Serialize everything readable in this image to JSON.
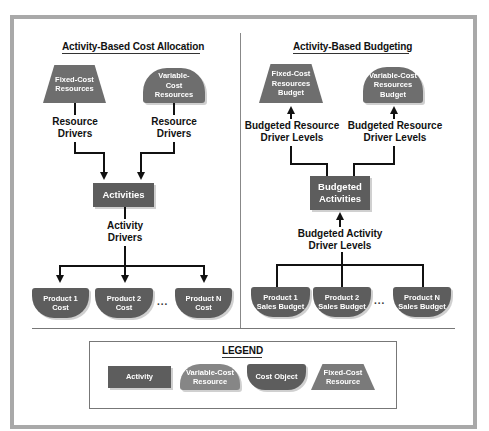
{
  "left_panel": {
    "title": "Activity-Based Cost Allocation",
    "fixed_cost": "Fixed-Cost Resources",
    "variable_cost_l1": "Variable-",
    "variable_cost_l2": "Cost",
    "variable_cost_l3": "Resources",
    "resource_drivers_left_l1": "Resource",
    "resource_drivers_left_l2": "Drivers",
    "resource_drivers_right_l1": "Resource",
    "resource_drivers_right_l2": "Drivers",
    "activities": "Activities",
    "activity_drivers_l1": "Activity",
    "activity_drivers_l2": "Drivers",
    "products": [
      {
        "l1": "Product 1",
        "l2": "Cost"
      },
      {
        "l1": "Product 2",
        "l2": "Cost"
      },
      {
        "l1": "Product N",
        "l2": "Cost"
      }
    ],
    "ellipsis": "..."
  },
  "right_panel": {
    "title": "Activity-Based Budgeting",
    "fixed_cost_l1": "Fixed-Cost",
    "fixed_cost_l2": "Resources",
    "fixed_cost_l3": "Budget",
    "variable_cost_l1": "Variable-Cost",
    "variable_cost_l2": "Resources",
    "variable_cost_l3": "Budget",
    "budgeted_resource_left_l1": "Budgeted Resource",
    "budgeted_resource_left_l2": "Driver Levels",
    "budgeted_resource_right_l1": "Budgeted Resource",
    "budgeted_resource_right_l2": "Driver Levels",
    "budgeted_activities_l1": "Budgeted",
    "budgeted_activities_l2": "Activities",
    "budgeted_activity_driver_l1": "Budgeted Activity",
    "budgeted_activity_driver_l2": "Driver Levels",
    "products": [
      {
        "l1": "Product 1",
        "l2": "Sales Budget"
      },
      {
        "l1": "Product 2",
        "l2": "Sales Budget"
      },
      {
        "l1": "Product N",
        "l2": "Sales Budget"
      }
    ],
    "ellipsis": "..."
  },
  "legend": {
    "title": "LEGEND",
    "activity": "Activity",
    "variable_l1": "Variable-Cost",
    "variable_l2": "Resource",
    "cost_object": "Cost Object",
    "fixed_l1": "Fixed-Cost",
    "fixed_l2": "Resource"
  },
  "colors": {
    "frame": "#a9a9a9",
    "shape_dark": "#5d5d5d",
    "shape_mid": "#6e6e6e",
    "shape_light": "#868686"
  }
}
